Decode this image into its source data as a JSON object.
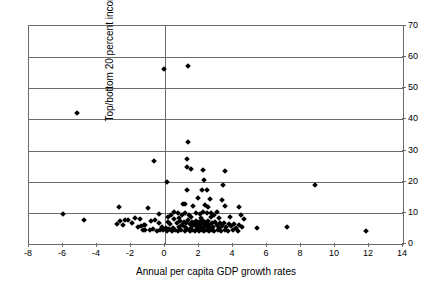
{
  "chart_data": {
    "type": "scatter",
    "title": "",
    "xlabel": "Annual per capita GDP growth rates",
    "ylabel": "Top/bottom 20 percent income cohort",
    "xlim": [
      -8,
      14
    ],
    "ylim": [
      0,
      70
    ],
    "xticks": [
      -8,
      -6,
      -4,
      -2,
      0,
      2,
      4,
      6,
      8,
      10,
      12,
      14
    ],
    "yticks": [
      0,
      10,
      20,
      30,
      40,
      50,
      60,
      70
    ],
    "xtick_labels": [
      "-8",
      "-6",
      "-4",
      "-2",
      "0",
      "2",
      "4",
      "6",
      "8",
      "10",
      "12",
      "14"
    ],
    "ytick_labels": [
      "0",
      "10",
      "20",
      "30",
      "40",
      "50",
      "60",
      "70"
    ],
    "ytick_side": "right",
    "grid": "horizontal-plus-zero-vertical",
    "marker": "diamond",
    "marker_color": "#000000",
    "marker_size_px": 4,
    "legend": "none",
    "series": [
      {
        "name": "countries",
        "points": [
          [
            -0.05,
            56.2
          ],
          [
            1.35,
            57.1
          ],
          [
            -5.2,
            42.0
          ],
          [
            1.35,
            32.6
          ],
          [
            -0.65,
            26.6
          ],
          [
            1.3,
            27.4
          ],
          [
            1.3,
            24.6
          ],
          [
            1.55,
            24.0
          ],
          [
            2.25,
            23.8
          ],
          [
            3.5,
            23.6
          ],
          [
            0.1,
            20.0
          ],
          [
            2.3,
            20.6
          ],
          [
            3.4,
            18.9
          ],
          [
            1.3,
            17.4
          ],
          [
            2.2,
            17.3
          ],
          [
            2.45,
            17.4
          ],
          [
            8.85,
            18.9
          ],
          [
            1.95,
            14.8
          ],
          [
            2.65,
            14.6
          ],
          [
            3.35,
            14.2
          ],
          [
            -2.7,
            11.9
          ],
          [
            -1.0,
            11.4
          ],
          [
            1.65,
            12.3
          ],
          [
            2.5,
            11.9
          ],
          [
            3.5,
            12.2
          ],
          [
            4.35,
            11.8
          ],
          [
            -6.0,
            9.7
          ],
          [
            -0.35,
            9.6
          ],
          [
            0.35,
            9.3
          ],
          [
            0.55,
            10.3
          ],
          [
            0.75,
            9.9
          ],
          [
            1.0,
            9.3
          ],
          [
            1.15,
            10.1
          ],
          [
            1.4,
            9.2
          ],
          [
            1.85,
            10.0
          ],
          [
            2.05,
            9.5
          ],
          [
            2.25,
            10.2
          ],
          [
            2.45,
            9.8
          ],
          [
            2.7,
            9.9
          ],
          [
            2.9,
            9.3
          ],
          [
            3.05,
            10.3
          ],
          [
            4.45,
            9.4
          ],
          [
            -4.75,
            7.6
          ],
          [
            -2.65,
            7.3
          ],
          [
            -2.35,
            7.8
          ],
          [
            -2.2,
            7.8
          ],
          [
            -1.75,
            8.4
          ],
          [
            -1.5,
            8.1
          ],
          [
            -1.25,
            6.0
          ],
          [
            -1.15,
            6.1
          ],
          [
            -0.85,
            7.3
          ],
          [
            -0.6,
            7.6
          ],
          [
            -0.35,
            6.8
          ],
          [
            -0.2,
            5.3
          ],
          [
            0.05,
            5.2
          ],
          [
            0.15,
            7.1
          ],
          [
            0.3,
            6.4
          ],
          [
            0.45,
            5.0
          ],
          [
            0.55,
            7.9
          ],
          [
            0.7,
            6.6
          ],
          [
            0.8,
            5.6
          ],
          [
            0.9,
            7.4
          ],
          [
            1.0,
            6.2
          ],
          [
            1.1,
            7.0
          ],
          [
            1.2,
            5.4
          ],
          [
            1.25,
            6.8
          ],
          [
            1.35,
            7.7
          ],
          [
            1.45,
            6.3
          ],
          [
            1.5,
            5.1
          ],
          [
            1.6,
            7.2
          ],
          [
            1.65,
            6.0
          ],
          [
            1.7,
            6.9
          ],
          [
            1.8,
            5.7
          ],
          [
            1.85,
            7.5
          ],
          [
            1.9,
            6.4
          ],
          [
            1.95,
            5.2
          ],
          [
            2.0,
            7.0
          ],
          [
            2.05,
            6.1
          ],
          [
            2.1,
            5.5
          ],
          [
            2.15,
            6.7
          ],
          [
            2.2,
            7.6
          ],
          [
            2.25,
            5.0
          ],
          [
            2.3,
            6.3
          ],
          [
            2.35,
            7.2
          ],
          [
            2.4,
            5.8
          ],
          [
            2.45,
            6.5
          ],
          [
            2.5,
            4.9
          ],
          [
            2.55,
            7.4
          ],
          [
            2.6,
            6.0
          ],
          [
            2.65,
            5.3
          ],
          [
            2.75,
            6.8
          ],
          [
            2.85,
            5.6
          ],
          [
            2.95,
            7.1
          ],
          [
            3.05,
            6.2
          ],
          [
            3.15,
            5.0
          ],
          [
            3.25,
            6.6
          ],
          [
            3.35,
            5.9
          ],
          [
            3.45,
            6.9
          ],
          [
            3.6,
            5.4
          ],
          [
            3.75,
            6.3
          ],
          [
            3.9,
            5.7
          ],
          [
            4.05,
            6.5
          ],
          [
            4.2,
            5.2
          ],
          [
            4.35,
            6.0
          ],
          [
            4.5,
            5.5
          ],
          [
            4.65,
            7.9
          ],
          [
            5.4,
            5.0
          ],
          [
            7.2,
            5.6
          ],
          [
            11.85,
            4.3
          ],
          [
            -1.3,
            4.6
          ],
          [
            -1.2,
            4.4
          ],
          [
            -0.9,
            4.5
          ],
          [
            -0.7,
            4.8
          ],
          [
            -0.5,
            4.3
          ],
          [
            -0.3,
            4.6
          ],
          [
            -0.1,
            4.4
          ],
          [
            0.1,
            4.2
          ],
          [
            0.25,
            4.7
          ],
          [
            0.4,
            4.3
          ],
          [
            0.6,
            4.5
          ],
          [
            0.75,
            4.1
          ],
          [
            0.95,
            4.6
          ],
          [
            1.15,
            4.3
          ],
          [
            1.3,
            4.8
          ],
          [
            1.45,
            4.2
          ],
          [
            1.6,
            4.5
          ],
          [
            1.75,
            4.3
          ],
          [
            1.9,
            4.7
          ],
          [
            2.0,
            4.1
          ],
          [
            2.15,
            4.4
          ],
          [
            2.3,
            4.2
          ],
          [
            2.45,
            4.6
          ],
          [
            2.6,
            4.3
          ],
          [
            2.75,
            4.5
          ],
          [
            2.9,
            4.1
          ],
          [
            3.1,
            4.4
          ],
          [
            3.3,
            4.2
          ],
          [
            3.5,
            4.6
          ],
          [
            3.7,
            4.3
          ],
          [
            4.0,
            4.5
          ],
          [
            4.3,
            4.2
          ],
          [
            -2.85,
            6.4
          ],
          [
            -2.5,
            6.2
          ],
          [
            -1.95,
            6.6
          ],
          [
            -1.6,
            5.3
          ],
          [
            -1.4,
            5.8
          ],
          [
            0.2,
            8.6
          ],
          [
            0.85,
            8.4
          ],
          [
            1.5,
            8.8
          ],
          [
            2.1,
            8.5
          ],
          [
            2.7,
            8.7
          ],
          [
            3.2,
            8.3
          ],
          [
            3.8,
            8.6
          ],
          [
            1.05,
            12.9
          ],
          [
            2.35,
            12.6
          ],
          [
            1.2,
            13.0
          ]
        ]
      }
    ]
  }
}
